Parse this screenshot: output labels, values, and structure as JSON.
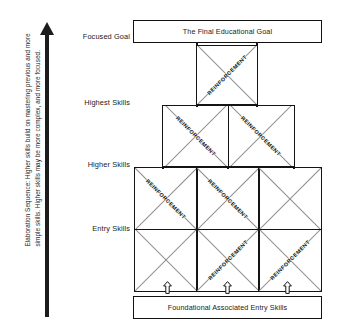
{
  "diagram": {
    "title_text": "Elaboration Sequence Pyramid",
    "side_caption": "Elaboration Sequence: Higher skills build on mastering previous and more simple skills. Higher skills may be more complex, and more focused.",
    "arrow_direction": "up",
    "tier_labels": [
      {
        "key": "focused-goal",
        "label": "Focused Goal"
      },
      {
        "key": "highest-skills",
        "label": "Highest Skills"
      },
      {
        "key": "higher-skills",
        "label": "Higher Skills"
      },
      {
        "key": "entry-skills",
        "label": "Entry Skills"
      }
    ],
    "top_box": {
      "label": "The Final Educational Goal"
    },
    "bottom_box": {
      "label": "Foundational Associated Entry Skills"
    },
    "reinforcement_label": "REINFORCEMENT",
    "tiers": [
      {
        "name": "highest-skills-tier",
        "columns": 1,
        "cells": [
          {
            "id": "t1c1",
            "reinforcement": true,
            "direction": "up-right"
          }
        ]
      },
      {
        "name": "higher-skills-tier",
        "columns": 2,
        "cells": [
          {
            "id": "t2c1",
            "reinforcement": true,
            "direction": "down-right"
          },
          {
            "id": "t2c2",
            "reinforcement": true,
            "direction": "down-right"
          }
        ]
      },
      {
        "name": "entry-skills-tier-upper-row",
        "columns": 3,
        "cells": [
          {
            "id": "t3r1c1",
            "reinforcement": true,
            "direction": "down-right"
          },
          {
            "id": "t3r1c2",
            "reinforcement": true,
            "direction": "down-right"
          },
          {
            "id": "t3r1c3",
            "reinforcement": false,
            "direction": "none"
          }
        ]
      },
      {
        "name": "entry-skills-tier-lower-row",
        "columns": 3,
        "cells": [
          {
            "id": "t3r2c1",
            "reinforcement": false,
            "direction": "none"
          },
          {
            "id": "t3r2c2",
            "reinforcement": true,
            "direction": "up-right"
          },
          {
            "id": "t3r2c3",
            "reinforcement": true,
            "direction": "up-right"
          }
        ]
      }
    ],
    "foundation_arrows": {
      "count": 3,
      "direction": "up"
    },
    "colors": {
      "outline": "#141414",
      "diagonal": "#8c8c8c",
      "text": "#1a1a1a",
      "background": "#ffffff",
      "side_arrow": "#1c1c1c"
    }
  }
}
